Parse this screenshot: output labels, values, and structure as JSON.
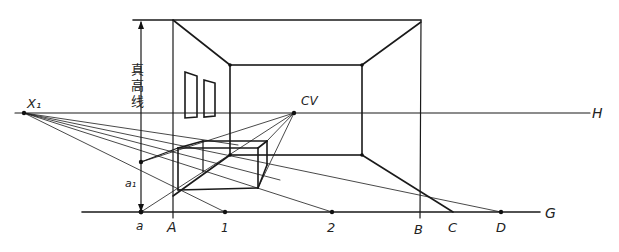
{
  "diagram": {
    "colors": {
      "ink": "#1a1a1a",
      "background": "#ffffff"
    },
    "labels": {
      "horizon": "H",
      "ground": "G",
      "center_of_vision": "CV",
      "measuring_point": "X₁",
      "true_height_line": "真高线",
      "true_height_char_1": "真",
      "true_height_char_2": "高",
      "true_height_char_3": "线",
      "point_a": "a",
      "point_a1": "a₁",
      "point_A": "A",
      "point_1": "1",
      "point_2": "2",
      "point_B": "B",
      "point_C": "C",
      "point_D": "D"
    },
    "points": {
      "X1": [
        24,
        113
      ],
      "CV": [
        294,
        113
      ],
      "a": [
        141,
        212
      ],
      "a1": [
        141,
        162
      ],
      "A": [
        173,
        212
      ],
      "p1": [
        225,
        212
      ],
      "p2": [
        332,
        212
      ],
      "B": [
        420,
        212
      ],
      "C": [
        453,
        212
      ],
      "D": [
        501,
        212
      ]
    },
    "lines": {
      "horizon_y": 113,
      "ground_y": 212,
      "picture_top_y": 20
    }
  }
}
